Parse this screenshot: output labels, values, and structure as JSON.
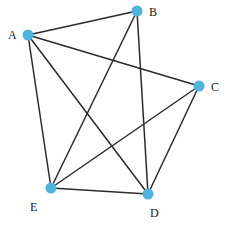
{
  "figure": {
    "type": "node-link-graph",
    "width": 237,
    "height": 237,
    "background_color": "#fefefe",
    "node_color": "#4fb3dc",
    "edge_color": "#2b2b2b",
    "label_color": "#1d1d1d",
    "node_radius": 5.5,
    "edge_width": 1.5
  },
  "nodes": [
    {
      "id": "A",
      "label": "A",
      "x": 28,
      "y": 35,
      "label_x": 8,
      "label_y": 29
    },
    {
      "id": "B",
      "label": "B",
      "x": 137,
      "y": 11,
      "label_x": 149,
      "label_y": 6
    },
    {
      "id": "C",
      "label": "C",
      "x": 199,
      "y": 86,
      "label_x": 211,
      "label_y": 81
    },
    {
      "id": "D",
      "label": "D",
      "x": 148,
      "y": 194,
      "label_x": 150,
      "label_y": 207
    },
    {
      "id": "E",
      "label": "E",
      "x": 51,
      "y": 188,
      "label_x": 30,
      "label_y": 201
    }
  ],
  "edges": [
    {
      "id": "edge-a-b",
      "source": "A",
      "target": "B"
    },
    {
      "id": "edge-a-c",
      "source": "A",
      "target": "C"
    },
    {
      "id": "edge-a-d",
      "source": "A",
      "target": "D"
    },
    {
      "id": "edge-a-e",
      "source": "A",
      "target": "E"
    },
    {
      "id": "edge-b-d",
      "source": "B",
      "target": "D"
    },
    {
      "id": "edge-b-e",
      "source": "B",
      "target": "E"
    },
    {
      "id": "edge-c-d",
      "source": "C",
      "target": "D"
    },
    {
      "id": "edge-c-e",
      "source": "C",
      "target": "E"
    },
    {
      "id": "edge-d-e",
      "source": "D",
      "target": "E"
    }
  ]
}
